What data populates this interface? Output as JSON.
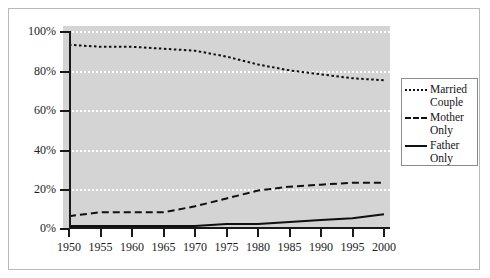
{
  "chart_data": {
    "type": "line",
    "title": "",
    "subtitle": "",
    "xlabel": "",
    "ylabel": "",
    "x": [
      1950,
      1955,
      1960,
      1965,
      1970,
      1975,
      1980,
      1985,
      1990,
      1995,
      2000
    ],
    "xlim": [
      1950,
      2000
    ],
    "ylim": [
      0,
      100
    ],
    "xticks": [
      "1950",
      "1955",
      "1960",
      "1965",
      "1970",
      "1975",
      "1980",
      "1985",
      "1990",
      "1995",
      "2000"
    ],
    "yticks": [
      "0%",
      "20%",
      "40%",
      "60%",
      "80%",
      "100%"
    ],
    "ytick_values": [
      0,
      20,
      40,
      60,
      80,
      100
    ],
    "grid": "horizontal-dotted-white",
    "plot_background": "#d4d4d4",
    "legend_position": "right-outside",
    "series": [
      {
        "name": "Married Couple",
        "style": "dotted",
        "color": "#101010",
        "values": [
          93,
          92,
          92,
          91,
          90,
          87,
          83,
          80,
          78,
          76,
          75
        ]
      },
      {
        "name": "Mother Only",
        "style": "dashed",
        "color": "#101010",
        "values": [
          6,
          8,
          8,
          8,
          11,
          15,
          19,
          21,
          22,
          23,
          23
        ]
      },
      {
        "name": "Father Only",
        "style": "solid",
        "color": "#101010",
        "values": [
          1,
          1,
          1,
          1,
          1,
          2,
          2,
          3,
          4,
          5,
          7
        ]
      }
    ]
  },
  "legend": {
    "entries": [
      {
        "label_line1": "Married",
        "label_line2": "Couple",
        "style": "dotted"
      },
      {
        "label_line1": "Mother",
        "label_line2": "Only",
        "style": "dashed"
      },
      {
        "label_line1": "Father",
        "label_line2": "Only",
        "style": "solid"
      }
    ]
  }
}
